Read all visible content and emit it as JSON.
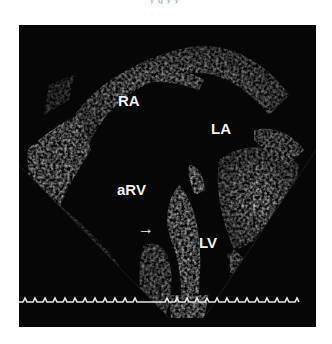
{
  "caption_fragment": "y   g   y   y",
  "echo": {
    "view": "apical four-chamber echocardiogram",
    "labels": {
      "ra": "RA",
      "la": "LA",
      "arv": "aRV",
      "lv": "LV"
    },
    "arrow": "→",
    "colors": {
      "background": "#060606",
      "tissue": "#cfcfcf",
      "ecg": "#e6e6e6",
      "page": "#ffffff"
    }
  }
}
